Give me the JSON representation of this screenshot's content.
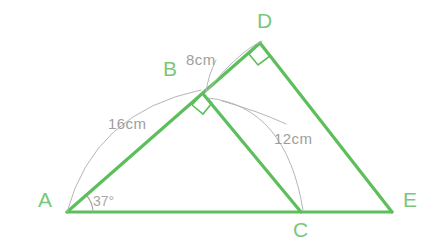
{
  "figure": {
    "background_color": "#ffffff",
    "line_color": "#5cbf5c",
    "arc_color": "#b0b0b0",
    "vertex_label_color": "#79c879",
    "measure_label_color": "#9e9e9e",
    "angle_label_color": "#a8a8a8",
    "line_width": 3.2,
    "arc_width": 1.0
  },
  "vertices": [
    {
      "name": "A",
      "label": "A",
      "x": 67,
      "y": 212,
      "label_x": 38,
      "label_y": 189
    },
    {
      "name": "B",
      "label": "B",
      "x": 204,
      "y": 95,
      "label_x": 163,
      "label_y": 58
    },
    {
      "name": "C",
      "label": "C",
      "x": 301,
      "y": 212,
      "label_x": 293,
      "label_y": 219
    },
    {
      "name": "D",
      "label": "D",
      "x": 260,
      "y": 43,
      "label_x": 257,
      "label_y": 10
    },
    {
      "name": "E",
      "label": "E",
      "x": 392,
      "y": 212,
      "label_x": 403,
      "label_y": 189
    }
  ],
  "edges": [
    {
      "name": "segment-A-E",
      "from": "A",
      "to": "E"
    },
    {
      "name": "segment-A-D",
      "from": "A",
      "to": "D"
    },
    {
      "name": "segment-B-C",
      "from": "B",
      "to": "C"
    },
    {
      "name": "segment-D-E",
      "from": "D",
      "to": "E"
    }
  ],
  "right_angles": [
    {
      "name": "right-angle-at-B",
      "vertex": "B",
      "between": "AB and BC"
    },
    {
      "name": "right-angle-at-D",
      "vertex": "D",
      "between": "BD and DE"
    }
  ],
  "measurements": [
    {
      "name": "measure-AB",
      "label": "16cm",
      "segment": "A-B",
      "label_x": 108,
      "label_y": 116,
      "arc": {
        "from_x": 67,
        "from_y": 212,
        "to_x": 201,
        "to_y": 90,
        "bow": 36
      }
    },
    {
      "name": "measure-BD",
      "label": "8cm",
      "segment": "B-D",
      "label_x": 186,
      "label_y": 52,
      "arc": {
        "from_x": 206,
        "from_y": 92,
        "to_x": 260,
        "to_y": 41,
        "bow": 16
      }
    },
    {
      "name": "measure-BC",
      "label": "12cm",
      "segment": "B-C",
      "label_x": 274,
      "label_y": 131,
      "arc": {
        "from_x": 208,
        "from_y": 98,
        "to_x": 303,
        "to_y": 210,
        "bow": 34
      }
    }
  ],
  "angles": [
    {
      "name": "angle-at-A",
      "label": "37°",
      "vertex": "A",
      "label_x": 93,
      "label_y": 194,
      "radius": 26
    }
  ]
}
